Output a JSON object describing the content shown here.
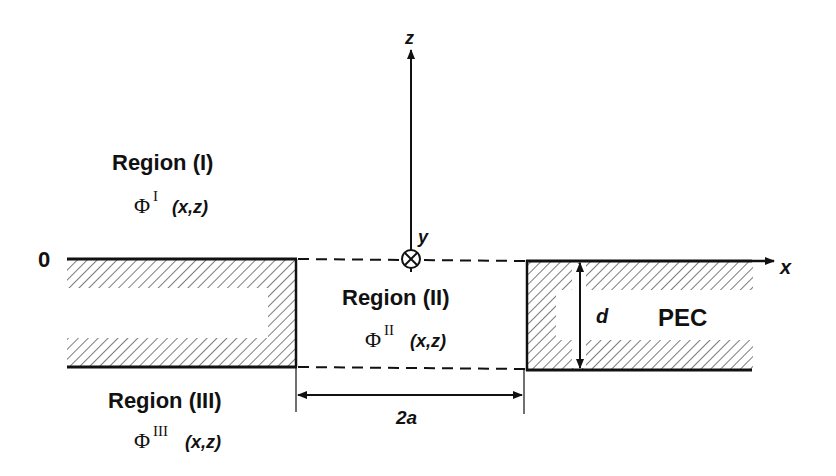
{
  "diagram": {
    "regions": [
      {
        "id": "I",
        "title": "Region (I)",
        "phi": "Φ",
        "sup": "I",
        "args": "(x,z)"
      },
      {
        "id": "II",
        "title": "Region (II)",
        "phi": "Φ",
        "sup": "II",
        "args": "(x,z)"
      },
      {
        "id": "III",
        "title": "Region (III)",
        "phi": "Φ",
        "sup": "III",
        "args": "(x,z)"
      }
    ],
    "axes": {
      "x_label": "x",
      "y_label": "y",
      "z_label": "z",
      "origin_label": "0"
    },
    "dimensions": {
      "thickness_label": "d",
      "slit_width_label": "2a"
    },
    "material_label": "PEC",
    "colors": {
      "line": "#111111",
      "hatch": "#444444",
      "background": "#ffffff"
    }
  }
}
